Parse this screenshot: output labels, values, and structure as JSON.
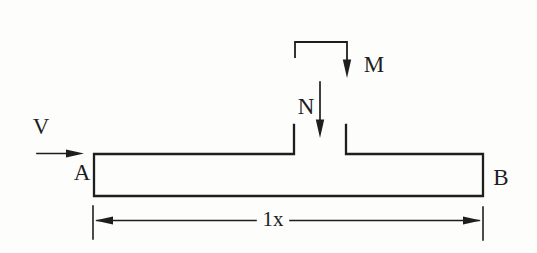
{
  "figure": {
    "type": "beam-free-body-diagram",
    "background_color": "#fdfdfc",
    "ink_color": "#1e1e1e",
    "labels": {
      "shear_force": "V",
      "axial_force": "N",
      "moment": "M",
      "end_left": "A",
      "end_right": "B",
      "span_dimension": "1x"
    }
  }
}
